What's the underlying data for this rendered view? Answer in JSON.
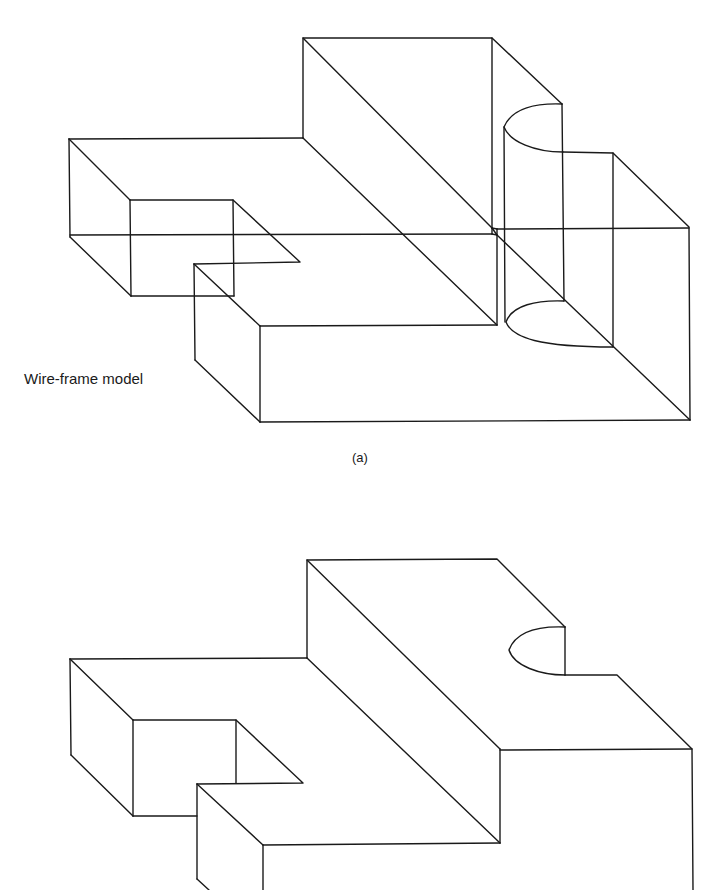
{
  "figure": {
    "top_cropped_title": "",
    "panel_a": {
      "label": "Wire-frame model",
      "caption": "(a)"
    },
    "panel_b": {
      "label": "",
      "caption": ""
    }
  },
  "colors": {
    "line": "#1a1a1a",
    "background": "#ffffff"
  }
}
